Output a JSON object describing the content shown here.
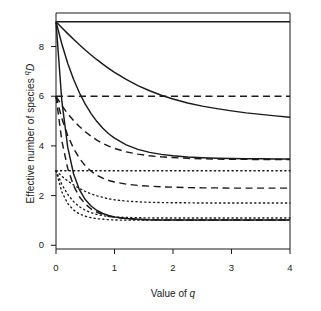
{
  "figure": {
    "title": "",
    "background": "#ffffff",
    "ink": "#1a1a1a"
  },
  "axes": {
    "x_label_prefix": "Value of ",
    "x_label_italic": "q",
    "y_label_prefix": "Effective number of species ",
    "y_label_sup": "q",
    "y_label_italic": "D"
  },
  "chart_data": {
    "type": "line",
    "title": "",
    "xlabel": "Value of q",
    "ylabel": "Effective number of species qD",
    "xlim": [
      0,
      4
    ],
    "ylim": [
      -0.15,
      9.35
    ],
    "xticks": [
      0,
      1,
      2,
      3,
      4
    ],
    "xticklabels": [
      "0",
      "1",
      "2",
      "3",
      "4"
    ],
    "yticks": [
      0,
      2,
      4,
      6,
      8
    ],
    "yticklabels": [
      "0",
      "2",
      "4",
      "6",
      "8"
    ],
    "grid": false,
    "legend": "none",
    "x": [
      0,
      0.1,
      0.2,
      0.3,
      0.4,
      0.5,
      0.6,
      0.7,
      0.8,
      0.9,
      1.0,
      1.2,
      1.4,
      1.6,
      1.8,
      2.0,
      2.25,
      2.5,
      2.75,
      3.0,
      3.25,
      3.5,
      3.75,
      4.0
    ],
    "series": [
      {
        "name": "S=9 even (linestyle solid, flat)",
        "linestyle": "solid",
        "start_value": 9.0,
        "end_value": 9.0,
        "values": [
          9.0,
          9.0,
          9.0,
          9.0,
          9.0,
          9.0,
          9.0,
          9.0,
          9.0,
          9.0,
          9.0,
          9.0,
          9.0,
          9.0,
          9.0,
          9.0,
          9.0,
          9.0,
          9.0,
          9.0,
          9.0,
          9.0,
          9.0,
          9.0
        ]
      },
      {
        "name": "S=9 slightly uneven (solid, gradual decline)",
        "linestyle": "solid",
        "start_value": 9.0,
        "end_value": 5.15,
        "values": [
          9.0,
          8.76,
          8.52,
          8.29,
          8.07,
          7.86,
          7.66,
          7.47,
          7.29,
          7.12,
          6.96,
          6.68,
          6.43,
          6.22,
          6.04,
          5.89,
          5.73,
          5.6,
          5.5,
          5.41,
          5.33,
          5.27,
          5.21,
          5.15
        ]
      },
      {
        "name": "S=9 highly uneven (solid, steep decline)",
        "linestyle": "solid",
        "start_value": 9.0,
        "end_value": 3.47,
        "values": [
          9.0,
          8.1,
          7.33,
          6.68,
          6.14,
          5.68,
          5.3,
          4.98,
          4.71,
          4.49,
          4.31,
          4.04,
          3.86,
          3.74,
          3.66,
          3.6,
          3.55,
          3.52,
          3.5,
          3.49,
          3.48,
          3.48,
          3.47,
          3.47
        ]
      },
      {
        "name": "S=9 extremely uneven (solid, very steep to 1)",
        "linestyle": "solid",
        "start_value": 9.0,
        "end_value": 1.02,
        "values": [
          9.0,
          5.8,
          3.95,
          2.88,
          2.24,
          1.84,
          1.58,
          1.4,
          1.28,
          1.2,
          1.14,
          1.08,
          1.05,
          1.03,
          1.02,
          1.02,
          1.02,
          1.02,
          1.02,
          1.02,
          1.02,
          1.02,
          1.02,
          1.02
        ]
      },
      {
        "name": "S=6 even (dashed, flat)",
        "linestyle": "dashed",
        "start_value": 6.0,
        "end_value": 6.0,
        "values": [
          6.0,
          6.0,
          6.0,
          6.0,
          6.0,
          6.0,
          6.0,
          6.0,
          6.0,
          6.0,
          6.0,
          6.0,
          6.0,
          6.0,
          6.0,
          6.0,
          6.0,
          6.0,
          6.0,
          6.0,
          6.0,
          6.0,
          6.0,
          6.0
        ]
      },
      {
        "name": "S=6 slightly uneven (dashed, gradual decline)",
        "linestyle": "dashed",
        "start_value": 6.0,
        "end_value": 3.45,
        "values": [
          6.0,
          5.62,
          5.3,
          5.02,
          4.78,
          4.57,
          4.39,
          4.23,
          4.1,
          3.99,
          3.9,
          3.76,
          3.67,
          3.6,
          3.56,
          3.53,
          3.5,
          3.48,
          3.47,
          3.46,
          3.46,
          3.45,
          3.45,
          3.45
        ]
      },
      {
        "name": "S=6 highly uneven (dashed, steep to 2.3)",
        "linestyle": "dashed",
        "start_value": 6.0,
        "end_value": 2.3,
        "values": [
          6.0,
          5.1,
          4.42,
          3.9,
          3.5,
          3.2,
          2.98,
          2.82,
          2.7,
          2.61,
          2.55,
          2.46,
          2.41,
          2.38,
          2.35,
          2.34,
          2.32,
          2.31,
          2.31,
          2.3,
          2.3,
          2.3,
          2.3,
          2.3
        ]
      },
      {
        "name": "S=6 extremely uneven (dashed, very steep to 1)",
        "linestyle": "dashed",
        "start_value": 6.0,
        "end_value": 1.02,
        "values": [
          6.0,
          4.2,
          3.1,
          2.4,
          1.95,
          1.66,
          1.46,
          1.33,
          1.24,
          1.17,
          1.13,
          1.07,
          1.04,
          1.03,
          1.02,
          1.02,
          1.02,
          1.02,
          1.02,
          1.02,
          1.02,
          1.02,
          1.02,
          1.02
        ]
      },
      {
        "name": "S=3 even (dotted, flat)",
        "linestyle": "dotted",
        "start_value": 3.0,
        "end_value": 3.0,
        "values": [
          3.0,
          3.0,
          3.0,
          3.0,
          3.0,
          3.0,
          3.0,
          3.0,
          3.0,
          3.0,
          3.0,
          3.0,
          3.0,
          3.0,
          3.0,
          3.0,
          3.0,
          3.0,
          3.0,
          3.0,
          3.0,
          3.0,
          3.0,
          3.0
        ]
      },
      {
        "name": "S=3 uneven (dotted, decline to 1.7)",
        "linestyle": "dotted",
        "start_value": 3.0,
        "end_value": 1.7,
        "values": [
          3.0,
          2.78,
          2.59,
          2.43,
          2.29,
          2.17,
          2.07,
          1.99,
          1.93,
          1.87,
          1.83,
          1.78,
          1.75,
          1.73,
          1.72,
          1.71,
          1.71,
          1.7,
          1.7,
          1.7,
          1.7,
          1.7,
          1.7,
          1.7
        ]
      },
      {
        "name": "S=3 highly uneven (dotted, decline to 1.1)",
        "linestyle": "dotted",
        "start_value": 3.0,
        "end_value": 1.1,
        "values": [
          3.0,
          2.45,
          2.05,
          1.76,
          1.55,
          1.41,
          1.31,
          1.24,
          1.19,
          1.16,
          1.14,
          1.12,
          1.11,
          1.1,
          1.1,
          1.1,
          1.1,
          1.1,
          1.1,
          1.1,
          1.1,
          1.1,
          1.1,
          1.1
        ]
      },
      {
        "name": "S=3 extremely uneven (dotted, steep to 1)",
        "linestyle": "dotted",
        "start_value": 3.0,
        "end_value": 1.01,
        "values": [
          3.0,
          2.15,
          1.68,
          1.42,
          1.26,
          1.17,
          1.11,
          1.07,
          1.05,
          1.03,
          1.02,
          1.01,
          1.01,
          1.01,
          1.01,
          1.01,
          1.01,
          1.01,
          1.01,
          1.01,
          1.01,
          1.01,
          1.01,
          1.01
        ]
      }
    ]
  },
  "plot_box": {
    "left": 56,
    "right": 290,
    "top": 13,
    "bottom": 249
  }
}
